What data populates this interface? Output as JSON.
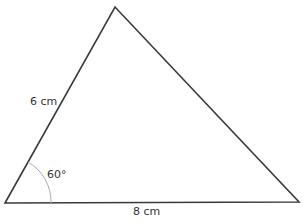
{
  "figure": {
    "type": "triangle",
    "vertices": {
      "bottom_left": [
        5,
        203
      ],
      "top": [
        115,
        7
      ],
      "bottom_right": [
        299,
        202
      ]
    },
    "stroke_color": "#3a3a3a",
    "arc_color": "#aaaaaa"
  },
  "labels": {
    "side_left": "6 cm",
    "side_bottom": "8 cm",
    "angle": "60°"
  }
}
